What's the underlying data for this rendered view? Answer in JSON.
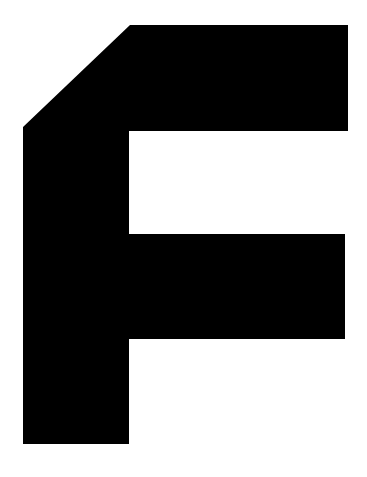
{
  "glyph": {
    "character": "F",
    "fill": "#000000",
    "background": "#ffffff",
    "points": "23,127 130,25 348,25 348,131 129,131 129,234 345,234 345,339 129,339 129,444 23,444"
  }
}
